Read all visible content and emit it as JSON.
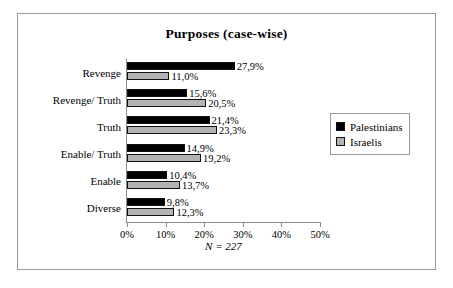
{
  "chart_data": {
    "type": "bar",
    "orientation": "horizontal",
    "title": "Purposes (case-wise)",
    "categories": [
      "Revenge",
      "Revenge/ Truth",
      "Truth",
      "Enable/ Truth",
      "Enable",
      "Diverse"
    ],
    "series": [
      {
        "name": "Palestinians",
        "color": "#000000",
        "values": [
          27.9,
          15.6,
          21.4,
          14.9,
          10.4,
          9.8
        ],
        "labels": [
          "27,9%",
          "15,6%",
          "21,4%",
          "14,9%",
          "10,4%",
          "9,8%"
        ]
      },
      {
        "name": "Israelis",
        "color": "#b3b3b3",
        "values": [
          11.0,
          20.5,
          23.3,
          19.2,
          13.7,
          12.3
        ],
        "labels": [
          "11,0%",
          "20,5%",
          "23,3%",
          "19,2%",
          "13,7%",
          "12,3%"
        ]
      }
    ],
    "xlabel": "",
    "ylabel": "",
    "xlim": [
      0,
      50
    ],
    "xticks": [
      0,
      10,
      20,
      30,
      40,
      50
    ],
    "xtick_labels": [
      "0%",
      "10%",
      "20%",
      "30%",
      "40%",
      "50%"
    ],
    "grid": false,
    "legend_position": "right",
    "footnote": "N = 227"
  }
}
